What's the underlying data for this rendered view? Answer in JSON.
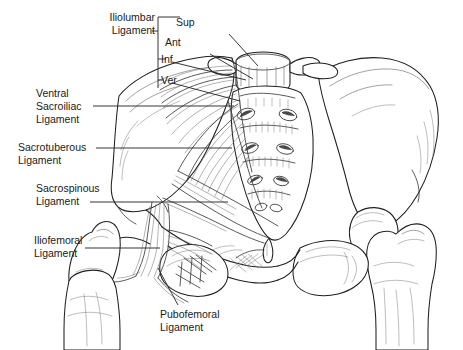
{
  "figure": {
    "view": "anterior",
    "background_color": "#ffffff",
    "ink_color": "#1a1a1a",
    "leader_line_color": "#2b2b2b",
    "width": 463,
    "height": 350
  },
  "labels": {
    "iliolumbar": {
      "line1": "Iliolumbar",
      "line2": "Ligament"
    },
    "ventral_sacroiliac": {
      "line1": "Ventral",
      "line2": "Sacroiliac",
      "line3": "Ligament"
    },
    "sacrotuberous": {
      "line1": "Sacrotuberous",
      "line2": "Ligament"
    },
    "sacrospinous": {
      "line1": "Sacrospinous",
      "line2": "Ligament"
    },
    "iliofemoral": {
      "line1": "Iliofemoral",
      "line2": "Ligament"
    },
    "pubofemoral": {
      "line1": "Pubofemoral",
      "line2": "Ligament"
    },
    "bands": {
      "sup": "Sup",
      "ant": "Ant",
      "inf": "Inf",
      "ver": "Ver"
    }
  },
  "structures": [
    "sacrum",
    "L5 vertebra",
    "left ilium",
    "right ilium",
    "left femur",
    "right femur",
    "pubic symphysis",
    "obturator foramen",
    "sacral foramina"
  ]
}
